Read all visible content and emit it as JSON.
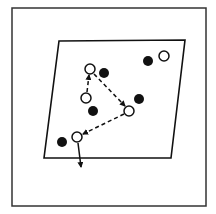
{
  "diagram": {
    "colors": {
      "ink": "#111111",
      "background": "#ffffff"
    },
    "frame": {
      "x": 12,
      "y": 8,
      "width": 194,
      "height": 198
    },
    "plane": {
      "points": [
        [
          59,
          41
        ],
        [
          185,
          40
        ],
        [
          171,
          158
        ],
        [
          44,
          158
        ]
      ]
    },
    "filled_circles": [
      {
        "id": "f1",
        "cx": 104,
        "cy": 73,
        "r": 5
      },
      {
        "id": "f2",
        "cx": 148,
        "cy": 61,
        "r": 5
      },
      {
        "id": "f3",
        "cx": 139,
        "cy": 99,
        "r": 5
      },
      {
        "id": "f4",
        "cx": 93,
        "cy": 111,
        "r": 5
      },
      {
        "id": "f5",
        "cx": 62,
        "cy": 142,
        "r": 5
      }
    ],
    "open_circles": [
      {
        "id": "o-top",
        "cx": 90,
        "cy": 69,
        "r": 5
      },
      {
        "id": "o-left",
        "cx": 86,
        "cy": 98,
        "r": 5
      },
      {
        "id": "o-right",
        "cx": 129,
        "cy": 111,
        "r": 5
      },
      {
        "id": "o-low",
        "cx": 77,
        "cy": 137,
        "r": 5
      },
      {
        "id": "o-corner",
        "cx": 164,
        "cy": 56,
        "r": 5
      }
    ],
    "arrows": [
      {
        "id": "a1",
        "from": "o-left",
        "to": "o-top",
        "style": "dashed",
        "x1": 87,
        "y1": 92,
        "x2": 89,
        "y2": 75
      },
      {
        "id": "a2",
        "from": "o-top",
        "to": "o-right",
        "style": "dashed",
        "x1": 94,
        "y1": 74,
        "x2": 125,
        "y2": 106
      },
      {
        "id": "a3",
        "from": "o-right",
        "to": "o-low",
        "style": "dashed",
        "x1": 124,
        "y1": 114,
        "x2": 83,
        "y2": 134
      },
      {
        "id": "a4",
        "from": "o-low",
        "to": "exit",
        "style": "solid",
        "x1": 78,
        "y1": 143,
        "x2": 81,
        "y2": 167
      }
    ]
  }
}
